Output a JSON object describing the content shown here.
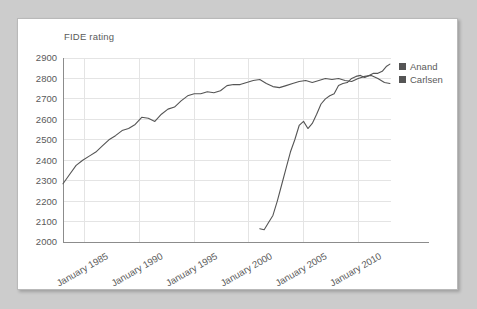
{
  "chart_data": {
    "type": "line",
    "title": "FIDE rating",
    "xlabel": "",
    "ylabel": "",
    "ylim": [
      2000,
      2900
    ],
    "yticks": [
      2000,
      2100,
      2200,
      2300,
      2400,
      2500,
      2600,
      2700,
      2800,
      2900
    ],
    "xticks": [
      "January 1985",
      "January 1990",
      "January 1995",
      "January 2000",
      "January 2005",
      "January 2010"
    ],
    "xtick_values": [
      1985,
      1990,
      1995,
      2000,
      2005,
      2010
    ],
    "xlim": [
      1983,
      2013
    ],
    "grid": true,
    "legend_position": "right",
    "series": [
      {
        "name": "Anand",
        "color": "#555555",
        "x": [
          1983.0,
          1983.6,
          1984.2,
          1984.8,
          1985.4,
          1986.0,
          1986.6,
          1987.2,
          1987.8,
          1988.4,
          1989.0,
          1989.6,
          1990.2,
          1990.8,
          1991.4,
          1992.0,
          1992.6,
          1993.2,
          1993.8,
          1994.4,
          1995.0,
          1995.6,
          1996.2,
          1996.8,
          1997.4,
          1998.0,
          1998.6,
          1999.2,
          1999.8,
          2000.4,
          2001.0,
          2001.6,
          2002.2,
          2002.8,
          2003.4,
          2004.0,
          2004.6,
          2005.2,
          2005.8,
          2006.4,
          2007.0,
          2007.6,
          2008.2,
          2008.8,
          2009.4,
          2010.0,
          2010.6,
          2011.2,
          2011.8,
          2012.4,
          2012.9
        ],
        "y": [
          2285,
          2330,
          2375,
          2400,
          2420,
          2440,
          2470,
          2500,
          2520,
          2545,
          2555,
          2575,
          2610,
          2605,
          2590,
          2625,
          2650,
          2660,
          2690,
          2715,
          2725,
          2725,
          2735,
          2730,
          2740,
          2765,
          2770,
          2770,
          2780,
          2790,
          2795,
          2775,
          2760,
          2755,
          2765,
          2775,
          2785,
          2790,
          2780,
          2790,
          2800,
          2795,
          2800,
          2790,
          2785,
          2800,
          2810,
          2815,
          2800,
          2780,
          2775
        ]
      },
      {
        "name": "Carlsen",
        "color": "#555555",
        "x": [
          2001.0,
          2001.4,
          2001.8,
          2002.2,
          2002.6,
          2003.0,
          2003.4,
          2003.8,
          2004.2,
          2004.6,
          2005.0,
          2005.4,
          2005.8,
          2006.2,
          2006.6,
          2007.0,
          2007.4,
          2007.8,
          2008.2,
          2008.6,
          2009.0,
          2009.4,
          2009.8,
          2010.2,
          2010.6,
          2011.0,
          2011.4,
          2011.8,
          2012.2,
          2012.6,
          2012.9
        ],
        "y": [
          2065,
          2060,
          2095,
          2130,
          2200,
          2280,
          2360,
          2440,
          2500,
          2570,
          2590,
          2555,
          2580,
          2625,
          2675,
          2700,
          2715,
          2725,
          2765,
          2775,
          2780,
          2800,
          2810,
          2815,
          2805,
          2815,
          2825,
          2825,
          2835,
          2860,
          2870
        ]
      }
    ]
  },
  "legend": {
    "items": [
      {
        "label": "Anand",
        "color": "#555555"
      },
      {
        "label": "Carlsen",
        "color": "#555555"
      }
    ]
  }
}
